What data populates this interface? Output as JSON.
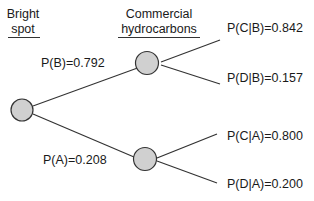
{
  "headers": {
    "stage1": {
      "line1": "Bright",
      "line2": "spot"
    },
    "stage2": {
      "line1": "Commercial",
      "line2": "hydrocarbons"
    }
  },
  "branches": {
    "B": {
      "label": "P(B)=0.792",
      "prob": 0.792
    },
    "A": {
      "label": "P(A)=0.208",
      "prob": 0.208
    },
    "CB": {
      "label": "P(C|B)=0.842",
      "prob": 0.842
    },
    "DB": {
      "label": "P(D|B)=0.157",
      "prob": 0.157
    },
    "CA": {
      "label": "P(C|A)=0.800",
      "prob": 0.8
    },
    "DA": {
      "label": "P(D|A)=0.200",
      "prob": 0.2
    }
  },
  "colors": {
    "node_fill": "#d0d0d0",
    "line": "#333333"
  }
}
